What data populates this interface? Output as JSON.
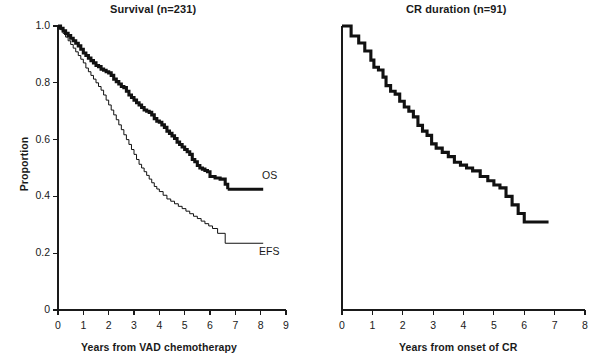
{
  "figure": {
    "background_color": "#ffffff",
    "ink_color": "#111111",
    "panels": [
      "survival",
      "cr_duration"
    ]
  },
  "left_panel": {
    "title": "Survival (n=231)",
    "xlabel": "Years from VAD chemotherapy",
    "ylabel": "Proportion",
    "xticks": [
      "0",
      "1",
      "2",
      "3",
      "4",
      "5",
      "6",
      "7",
      "8",
      "9"
    ],
    "yticks": [
      "0",
      "0.2",
      "0.4",
      "0.6",
      "0.8",
      "1.0"
    ],
    "series_labels": {
      "os": "OS",
      "efs": "EFS"
    }
  },
  "right_panel": {
    "title": "CR duration (n=91)",
    "xlabel": "Years from onset of CR",
    "xticks": [
      "0",
      "1",
      "2",
      "3",
      "4",
      "5",
      "6",
      "7",
      "8"
    ],
    "yticks": []
  },
  "chart_data": [
    {
      "type": "line",
      "subtype": "kaplan-meier-step",
      "title": "Survival (n=231)",
      "xlabel": "Years from VAD chemotherapy",
      "ylabel": "Proportion",
      "xlim": [
        0,
        9
      ],
      "ylim": [
        0,
        1.0
      ],
      "xticks": [
        0,
        1,
        2,
        3,
        4,
        5,
        6,
        7,
        8,
        9
      ],
      "yticks": [
        0,
        0.2,
        0.4,
        0.6,
        0.8,
        1.0
      ],
      "grid": false,
      "legend": "inline-curve-labels",
      "n": 231,
      "annotations": [
        {
          "text": "OS",
          "x": 8.05,
          "y": 0.45
        },
        {
          "text": "EFS",
          "x": 7.95,
          "y": 0.255
        }
      ],
      "series": [
        {
          "name": "OS",
          "label": "OS",
          "line_width": "thick",
          "n_at_risk_start": 231,
          "final_proportion": 0.425,
          "x": [
            0.0,
            0.1,
            0.2,
            0.3,
            0.4,
            0.5,
            0.6,
            0.7,
            0.8,
            0.9,
            1.0,
            1.1,
            1.2,
            1.3,
            1.4,
            1.5,
            1.6,
            1.7,
            1.8,
            1.9,
            2.0,
            2.1,
            2.2,
            2.3,
            2.4,
            2.5,
            2.6,
            2.7,
            2.8,
            2.9,
            3.0,
            3.1,
            3.2,
            3.3,
            3.4,
            3.5,
            3.6,
            3.7,
            3.8,
            3.9,
            4.0,
            4.1,
            4.2,
            4.3,
            4.4,
            4.5,
            4.6,
            4.7,
            4.8,
            4.9,
            5.0,
            5.1,
            5.2,
            5.3,
            5.4,
            5.5,
            5.6,
            5.7,
            5.8,
            5.9,
            6.0,
            6.2,
            6.4,
            6.6,
            6.7,
            8.1
          ],
          "y": [
            1.0,
            0.992,
            0.983,
            0.974,
            0.966,
            0.957,
            0.948,
            0.939,
            0.93,
            0.918,
            0.905,
            0.896,
            0.887,
            0.878,
            0.87,
            0.861,
            0.857,
            0.848,
            0.844,
            0.839,
            0.835,
            0.826,
            0.813,
            0.804,
            0.796,
            0.787,
            0.783,
            0.77,
            0.757,
            0.748,
            0.739,
            0.73,
            0.722,
            0.713,
            0.704,
            0.7,
            0.696,
            0.687,
            0.674,
            0.665,
            0.661,
            0.652,
            0.643,
            0.63,
            0.622,
            0.613,
            0.604,
            0.591,
            0.583,
            0.574,
            0.565,
            0.557,
            0.548,
            0.53,
            0.522,
            0.509,
            0.5,
            0.496,
            0.491,
            0.487,
            0.47,
            0.465,
            0.461,
            0.443,
            0.425,
            0.425
          ]
        },
        {
          "name": "EFS",
          "label": "EFS",
          "line_width": "thin",
          "n_at_risk_start": 231,
          "final_proportion": 0.235,
          "x": [
            0.0,
            0.1,
            0.2,
            0.3,
            0.4,
            0.5,
            0.6,
            0.7,
            0.8,
            0.9,
            1.0,
            1.1,
            1.2,
            1.3,
            1.4,
            1.5,
            1.6,
            1.7,
            1.8,
            1.9,
            2.0,
            2.1,
            2.2,
            2.3,
            2.4,
            2.5,
            2.6,
            2.7,
            2.8,
            2.9,
            3.0,
            3.1,
            3.2,
            3.3,
            3.4,
            3.5,
            3.6,
            3.7,
            3.8,
            3.9,
            4.0,
            4.15,
            4.3,
            4.45,
            4.6,
            4.75,
            4.9,
            5.05,
            5.2,
            5.35,
            5.5,
            5.65,
            5.8,
            5.95,
            6.1,
            6.3,
            6.6,
            8.1
          ],
          "y": [
            1.0,
            0.987,
            0.974,
            0.961,
            0.948,
            0.935,
            0.922,
            0.909,
            0.896,
            0.883,
            0.87,
            0.852,
            0.839,
            0.826,
            0.813,
            0.8,
            0.787,
            0.774,
            0.757,
            0.739,
            0.722,
            0.704,
            0.687,
            0.67,
            0.652,
            0.635,
            0.617,
            0.6,
            0.583,
            0.565,
            0.548,
            0.53,
            0.513,
            0.5,
            0.487,
            0.474,
            0.461,
            0.448,
            0.435,
            0.426,
            0.417,
            0.404,
            0.391,
            0.383,
            0.374,
            0.365,
            0.357,
            0.348,
            0.339,
            0.33,
            0.322,
            0.313,
            0.304,
            0.296,
            0.287,
            0.27,
            0.235,
            0.235
          ]
        }
      ]
    },
    {
      "type": "line",
      "subtype": "kaplan-meier-step",
      "title": "CR duration (n=91)",
      "xlabel": "Years from onset of CR",
      "ylabel": "Proportion",
      "xlim": [
        0,
        8
      ],
      "ylim": [
        0,
        1.0
      ],
      "xticks": [
        0,
        1,
        2,
        3,
        4,
        5,
        6,
        7,
        8
      ],
      "yticks": [],
      "grid": false,
      "legend": "none",
      "n": 91,
      "annotations": [],
      "series": [
        {
          "name": "CR duration",
          "label": "CR duration",
          "line_width": "thick",
          "n_at_risk_start": 91,
          "final_proportion": 0.31,
          "x": [
            0.0,
            0.3,
            0.55,
            0.75,
            0.95,
            1.05,
            1.2,
            1.35,
            1.45,
            1.6,
            1.75,
            1.9,
            2.05,
            2.2,
            2.35,
            2.5,
            2.65,
            2.8,
            2.95,
            3.1,
            3.3,
            3.5,
            3.7,
            3.9,
            4.1,
            4.3,
            4.55,
            4.8,
            5.0,
            5.2,
            5.4,
            5.6,
            5.8,
            6.0,
            6.8
          ],
          "y": [
            1.0,
            0.965,
            0.94,
            0.912,
            0.88,
            0.855,
            0.845,
            0.82,
            0.79,
            0.77,
            0.76,
            0.735,
            0.715,
            0.7,
            0.68,
            0.65,
            0.63,
            0.615,
            0.585,
            0.57,
            0.555,
            0.54,
            0.52,
            0.51,
            0.5,
            0.49,
            0.47,
            0.455,
            0.44,
            0.43,
            0.4,
            0.37,
            0.34,
            0.31,
            0.31
          ]
        }
      ]
    }
  ]
}
